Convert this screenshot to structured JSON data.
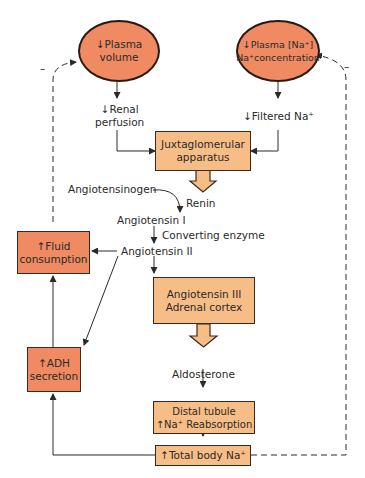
{
  "nodes": {
    "plasma_volume": "↓Plasma\nvolume",
    "plasma_volume_l1": "↓Plasma",
    "plasma_volume_l2": "volume",
    "plasma_na_l1": "↓Plasma [Na⁺]",
    "plasma_na_l2": "Na⁺concentration",
    "renal_l1": "↓Renal",
    "renal_l2": "perfusion",
    "filtered_na": "↓Filtered Na⁺",
    "jga_l1": "Juxtaglomerular",
    "jga_l2": "apparatus",
    "angiotensinogen": "Angiotensinogen",
    "renin": "Renin",
    "angiotensin_i": "Angiotensin I",
    "converting_enzyme": "Converting enzyme",
    "angiotensin_ii": "Angiotensin II",
    "fluid_l1": "↑Fluid",
    "fluid_l2": "consumption",
    "adh_l1": "↑ADH",
    "adh_l2": "secretion",
    "ang3_l1": "Angiotensin III",
    "ang3_l2": "Adrenal cortex",
    "aldosterone": "Aldosterone",
    "distal_l1": "Distal tubule",
    "distal_l2": "↑Na⁺ Reabsorption",
    "total_na": "↑Total body Na⁺",
    "minus_left": "–",
    "minus_right": "–"
  },
  "colors": {
    "ellipse_fill": "#ef8a62",
    "tan_box_fill": "#f7bd86",
    "orange_box_fill": "#ef8a62",
    "line": "#2a2a2a"
  }
}
